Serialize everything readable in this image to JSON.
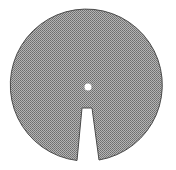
{
  "figure": {
    "disk": {
      "cx": 88,
      "cy": 85,
      "r": 76,
      "fill": "#9a9a9a",
      "stroke": "#555555"
    },
    "center_hole": {
      "cx": 88,
      "cy": 87,
      "r": 3.5,
      "fill": "#ffffff"
    },
    "slot": {
      "top_left": [
        82,
        108
      ],
      "top_right": [
        92,
        108
      ],
      "bottom_left": [
        77,
        162
      ],
      "bottom_right": [
        99,
        162
      ],
      "fill": "#ffffff"
    },
    "background": "#ffffff"
  }
}
